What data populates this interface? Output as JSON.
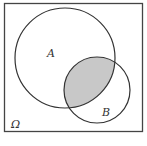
{
  "diagram": {
    "type": "venn",
    "universe_label": "Ω",
    "sets": [
      {
        "label": "A",
        "cx": 65,
        "cy": 58,
        "r": 50
      },
      {
        "label": "B",
        "cx": 97,
        "cy": 90,
        "r": 33
      }
    ],
    "shaded_region": "A ∩ B",
    "colors": {
      "stroke": "#333333",
      "shade": "#c8c8c8",
      "background": "#ffffff"
    }
  }
}
